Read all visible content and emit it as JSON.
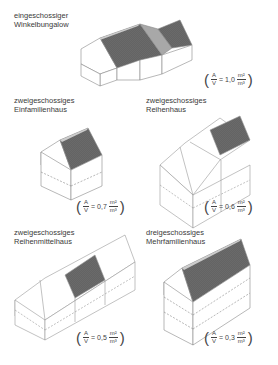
{
  "figure": {
    "houses": [
      {
        "title_line1": "eingeschossiger",
        "title_line2": "Winkelbungalow",
        "ratio": "1,0",
        "a": "A",
        "v": "V",
        "eq": "=",
        "unit_num": "m²",
        "unit_den": "m³"
      },
      {
        "title_line1": "zweigeschossiges",
        "title_line2": "Einfamilienhaus",
        "ratio": "0,7",
        "a": "A",
        "v": "V",
        "eq": "=",
        "unit_num": "m²",
        "unit_den": "m³"
      },
      {
        "title_line1": "zweigeschossiges",
        "title_line2": "Reihenhaus",
        "ratio": "0,6",
        "a": "A",
        "v": "V",
        "eq": "=",
        "unit_num": "m²",
        "unit_den": "m³"
      },
      {
        "title_line1": "zweigeschossiges",
        "title_line2": "Reihenmittelhaus",
        "ratio": "0,5",
        "a": "A",
        "v": "V",
        "eq": "=",
        "unit_num": "m²",
        "unit_den": "m³"
      },
      {
        "title_line1": "dreigeschossiges",
        "title_line2": "Mehrfamilienhaus",
        "ratio": "0,3",
        "a": "A",
        "v": "V",
        "eq": "=",
        "unit_num": "m²",
        "unit_den": "m³"
      }
    ],
    "paren_open": "(",
    "paren_close": ")",
    "colors": {
      "roof_dark": "#6a6a6a",
      "roof_light": "#a8a8a8",
      "roof_edge": "#c8c8c8",
      "line": "#888888"
    }
  }
}
